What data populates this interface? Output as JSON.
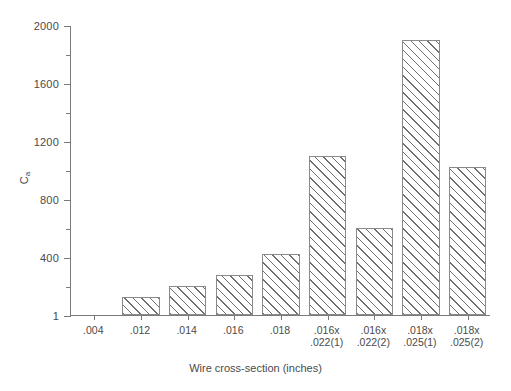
{
  "chart_data": {
    "type": "bar",
    "title": "",
    "xlabel": "Wire cross-section (inches)",
    "ylabel": "Ca",
    "ylabel_base": "C",
    "ylabel_sub": "a",
    "ylim": [
      1,
      2000
    ],
    "ytick_values": [
      1,
      400,
      800,
      1200,
      1600,
      2000
    ],
    "ytick_labels": [
      "1",
      "400",
      "800",
      "1200",
      "1600",
      "2000"
    ],
    "yminor_values": [
      200,
      600,
      1000,
      1400,
      1800
    ],
    "grid": false,
    "legend": null,
    "bar_style": {
      "fill": "diagonal-hatch",
      "hatch_color": "#6f6f6f",
      "edge_color": "#8a8a8a",
      "face_color": "#ffffff"
    },
    "categories": [
      ".004",
      ".012",
      ".014",
      ".016",
      ".018",
      ".016x .022(1)",
      ".016x .022(2)",
      ".018x .025(1)",
      ".018x .025(2)"
    ],
    "category_labels": [
      {
        "line1": ".004",
        "line2": ""
      },
      {
        "line1": ".012",
        "line2": ""
      },
      {
        "line1": ".014",
        "line2": ""
      },
      {
        "line1": ".016",
        "line2": ""
      },
      {
        "line1": ".018",
        "line2": ""
      },
      {
        "line1": ".016x",
        "line2": ".022(1)"
      },
      {
        "line1": ".016x",
        "line2": ".022(2)"
      },
      {
        "line1": ".018x",
        "line2": ".025(1)"
      },
      {
        "line1": ".018x",
        "line2": ".025(2)"
      }
    ],
    "values": [
      0,
      125,
      200,
      280,
      420,
      1100,
      600,
      1900,
      1020
    ]
  }
}
